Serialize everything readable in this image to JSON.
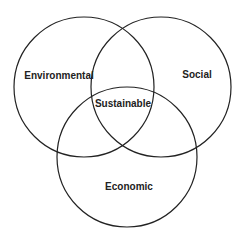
{
  "diagram": {
    "type": "venn",
    "stroke_color": "#222222",
    "circles": [
      {
        "name": "environmental",
        "label": "Environmental",
        "cx": 84,
        "cy": 87,
        "r": 70,
        "label_x": 59,
        "label_y": 79
      },
      {
        "name": "social",
        "label": "Social",
        "cx": 161,
        "cy": 87,
        "r": 70,
        "label_x": 197,
        "label_y": 78
      },
      {
        "name": "economic",
        "label": "Economic",
        "cx": 127,
        "cy": 157,
        "r": 70,
        "label_x": 129,
        "label_y": 190
      }
    ],
    "center_label": {
      "label": "Sustainable",
      "x": 123,
      "y": 107
    }
  }
}
